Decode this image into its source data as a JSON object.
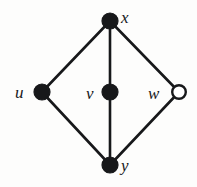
{
  "figure": {
    "background_color": "#fdfdfc",
    "ink_color": "#17181a",
    "width": 197,
    "height": 187
  },
  "graph": {
    "type": "undirected-graph",
    "node_radius": 8,
    "open_node_radius": 8,
    "edge_width": 2.6,
    "nodes": [
      {
        "id": "x",
        "label": "x",
        "cx": 110,
        "cy": 21,
        "fill": "filled",
        "fill_color": "#17181a",
        "stroke_color": "#17181a",
        "label_position": "right"
      },
      {
        "id": "u",
        "label": "u",
        "cx": 42,
        "cy": 92,
        "fill": "filled",
        "fill_color": "#17181a",
        "stroke_color": "#17181a",
        "label_position": "left"
      },
      {
        "id": "v",
        "label": "v",
        "cx": 110,
        "cy": 92,
        "fill": "filled",
        "fill_color": "#17181a",
        "stroke_color": "#17181a",
        "label_position": "left"
      },
      {
        "id": "w",
        "label": "w",
        "cx": 179,
        "cy": 92,
        "fill": "open",
        "fill_color": "#ffffff",
        "stroke_color": "#17181a",
        "label_position": "left"
      },
      {
        "id": "y",
        "label": "y",
        "cx": 110,
        "cy": 165,
        "fill": "filled",
        "fill_color": "#17181a",
        "stroke_color": "#17181a",
        "label_position": "right"
      }
    ],
    "edges": [
      {
        "from": "x",
        "to": "u"
      },
      {
        "from": "x",
        "to": "v"
      },
      {
        "from": "x",
        "to": "w"
      },
      {
        "from": "u",
        "to": "y"
      },
      {
        "from": "v",
        "to": "y"
      },
      {
        "from": "w",
        "to": "y"
      }
    ]
  }
}
